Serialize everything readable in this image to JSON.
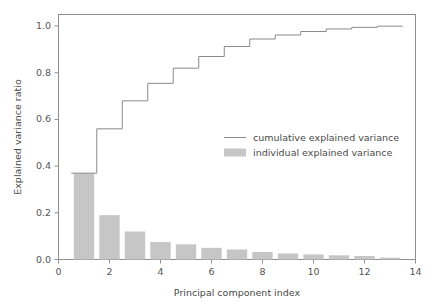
{
  "chart_data": {
    "type": "bar",
    "title": "",
    "xlabel": "Principal component index",
    "ylabel": "Explained variance ratio",
    "xlim": [
      0,
      14
    ],
    "ylim": [
      0.0,
      1.05
    ],
    "xticks": [
      0,
      2,
      4,
      6,
      8,
      10,
      12,
      14
    ],
    "xticklabels": [
      "0",
      "2",
      "4",
      "6",
      "8",
      "10",
      "12",
      "14"
    ],
    "yticks": [
      0.0,
      0.2,
      0.4,
      0.6,
      0.8,
      1.0
    ],
    "yticklabels": [
      "0.0",
      "0.2",
      "0.4",
      "0.6",
      "0.8",
      "1.0"
    ],
    "grid": false,
    "legend_position": "center-right",
    "categories": [
      1,
      2,
      3,
      4,
      5,
      6,
      7,
      8,
      9,
      10,
      11,
      12,
      13
    ],
    "series": [
      {
        "name": "individual explained variance",
        "type": "bar",
        "color": "#c6c6c6",
        "values": [
          0.37,
          0.19,
          0.12,
          0.075,
          0.065,
          0.05,
          0.043,
          0.032,
          0.026,
          0.022,
          0.018,
          0.015,
          0.008
        ]
      },
      {
        "name": "cumulative explained variance",
        "type": "step",
        "color": "#8a8a8a",
        "values": [
          0.37,
          0.56,
          0.68,
          0.755,
          0.82,
          0.87,
          0.913,
          0.945,
          0.962,
          0.977,
          0.988,
          0.995,
          1.0
        ]
      }
    ]
  },
  "legend": {
    "entries": [
      {
        "label": "cumulative explained variance",
        "marker": "line"
      },
      {
        "label": "individual explained variance",
        "marker": "patch"
      }
    ]
  },
  "axes": {
    "x_title": "Principal component index",
    "y_title": "Explained variance ratio"
  }
}
